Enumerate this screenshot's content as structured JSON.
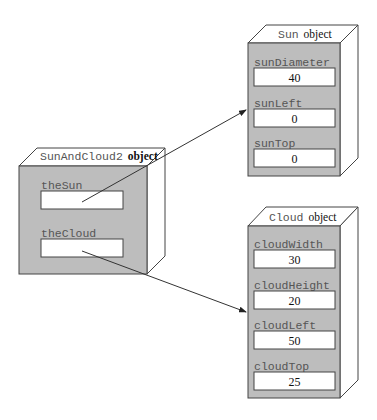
{
  "colors": {
    "face": "#bdbdbd",
    "side": "#ffffff",
    "stroke": "#444444",
    "field": "#ffffff",
    "arrow": "#333333"
  },
  "objects": {
    "main": {
      "class_name": "SunAndCloud2",
      "suffix": "object",
      "fields": [
        {
          "name": "theSun",
          "value": ""
        },
        {
          "name": "theCloud",
          "value": ""
        }
      ]
    },
    "sun": {
      "class_name": "Sun",
      "suffix": "object",
      "fields": [
        {
          "name": "sunDiameter",
          "value": "40"
        },
        {
          "name": "sunLeft",
          "value": "0"
        },
        {
          "name": "sunTop",
          "value": "0"
        }
      ]
    },
    "cloud": {
      "class_name": "Cloud",
      "suffix": "object",
      "fields": [
        {
          "name": "cloudWidth",
          "value": "30"
        },
        {
          "name": "cloudHeight",
          "value": "20"
        },
        {
          "name": "cloudLeft",
          "value": "50"
        },
        {
          "name": "cloudTop",
          "value": "25"
        }
      ]
    }
  },
  "references": [
    {
      "from": "theSun",
      "to": "Sun object"
    },
    {
      "from": "theCloud",
      "to": "Cloud object"
    }
  ]
}
